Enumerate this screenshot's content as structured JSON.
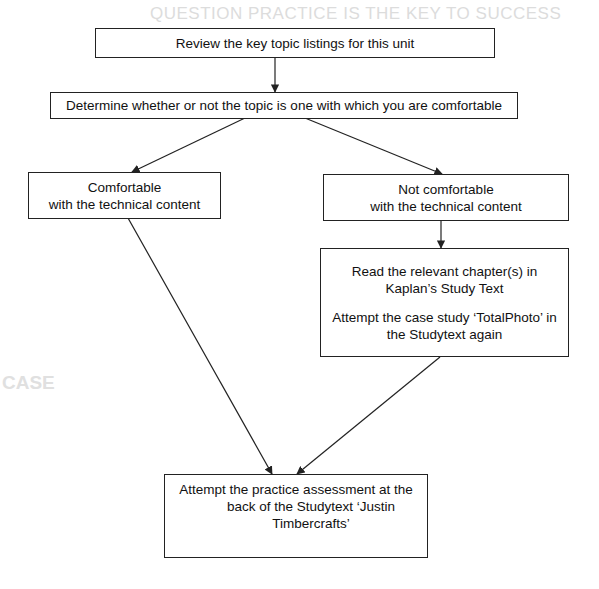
{
  "background_bleed": {
    "heading": "QUESTION PRACTICE IS THE KEY TO SUCCESS",
    "section_heading": "CASE"
  },
  "flowchart": {
    "nodes": {
      "review": {
        "lines": [
          "Review the key topic listings for this unit"
        ]
      },
      "determine": {
        "lines": [
          "Determine whether or not the topic is one with which you are comfortable"
        ]
      },
      "comfortable": {
        "lines": [
          "Comfortable",
          "with the technical content"
        ]
      },
      "not_comfortable": {
        "lines": [
          "Not comfortable",
          "with the technical content"
        ]
      },
      "study": {
        "para1": [
          "Read the relevant chapter(s) in",
          "Kaplan’s Study Text"
        ],
        "para2": [
          "Attempt the case study ‘TotalPhoto’ in",
          "the Studytext again"
        ]
      },
      "practice": {
        "lines": [
          "Attempt the practice assessment at the",
          "back of the Studytext ‘Justin",
          "Timbercrafts’"
        ]
      }
    },
    "edges": [
      {
        "from": "review",
        "to": "determine"
      },
      {
        "from": "determine",
        "to": "comfortable"
      },
      {
        "from": "determine",
        "to": "not_comfortable"
      },
      {
        "from": "not_comfortable",
        "to": "study"
      },
      {
        "from": "comfortable",
        "to": "practice"
      },
      {
        "from": "study",
        "to": "practice"
      }
    ],
    "colors": {
      "line": "#222222",
      "box_border": "#222222",
      "text": "#111111"
    }
  }
}
